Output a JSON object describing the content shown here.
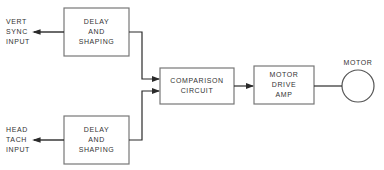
{
  "diagram": {
    "type": "block-diagram",
    "inputs": [
      {
        "id": "vert",
        "label": "VERT\nSYNC\nINPUT"
      },
      {
        "id": "head",
        "label": "HEAD\nTACH\nINPUT"
      }
    ],
    "blocks": [
      {
        "id": "delay_top",
        "label": "DELAY\nAND\nSHAPING"
      },
      {
        "id": "delay_bottom",
        "label": "DELAY\nAND\nSHAPING"
      },
      {
        "id": "comparison",
        "label": "COMPARISON\nCIRCUIT"
      },
      {
        "id": "motor_drive",
        "label": "MOTOR\nDRIVE\nAMP"
      }
    ],
    "output": {
      "id": "motor",
      "label": "MOTOR",
      "shape": "circle"
    },
    "edges": [
      {
        "from": "vert",
        "to": "delay_top"
      },
      {
        "from": "head",
        "to": "delay_bottom"
      },
      {
        "from": "delay_top",
        "to": "comparison"
      },
      {
        "from": "delay_bottom",
        "to": "comparison"
      },
      {
        "from": "comparison",
        "to": "motor_drive"
      },
      {
        "from": "motor_drive",
        "to": "motor"
      }
    ],
    "colors": {
      "line": "#2a2a2a",
      "background": "#ffffff"
    }
  }
}
